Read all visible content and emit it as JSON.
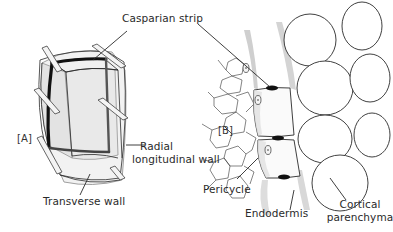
{
  "figure": {
    "panels": [
      {
        "id": "A",
        "label": "[A]"
      },
      {
        "id": "B",
        "label": "[B]"
      }
    ],
    "labels": {
      "casparian_strip": "Casparian strip",
      "radial_line1": "Radial",
      "radial_line2": "longitudinal wall",
      "transverse_wall": "Transverse wall",
      "pericycle": "Pericycle",
      "endodermis": "Endodermis",
      "cortical_line1": "Cortical",
      "cortical_line2": "parenchyma"
    },
    "colors": {
      "line": "#2a2a2a",
      "cell_fill": "#e6e6e6",
      "strip": "#111111",
      "background": "#ffffff"
    }
  }
}
